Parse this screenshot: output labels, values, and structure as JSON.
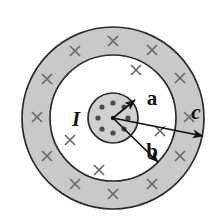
{
  "figure": {
    "center": {
      "x": 113,
      "y": 118
    },
    "colors": {
      "outline": "#2b2b2b",
      "shaded_ring_fill": "#c9c9c9",
      "inner_conductor_fill": "#d0d0d0",
      "gap_fill": "#ffffff",
      "dot_fill": "#4a4a4a",
      "cross_stroke": "#6a6a6a",
      "arrow_stroke": "#111111",
      "label_color": "#111111",
      "background": "#ffffff"
    },
    "circles": [
      {
        "name": "inner-conductor",
        "radius": 25,
        "fill": "#d0d0d0"
      },
      {
        "name": "inner-shield-boundary",
        "radius": 63,
        "fill": "#ffffff"
      },
      {
        "name": "outer-shield-boundary",
        "radius": 91,
        "fill": "#c9c9c9"
      }
    ],
    "labels": [
      {
        "key": "a",
        "text": "a",
        "x": 152,
        "y": 105,
        "style": "upright"
      },
      {
        "key": "b",
        "text": "b",
        "x": 152,
        "y": 158,
        "style": "upright"
      },
      {
        "key": "c",
        "text": "c",
        "x": 196,
        "y": 119,
        "style": "italic"
      },
      {
        "key": "I",
        "text": "I",
        "x": 76,
        "y": 126,
        "style": "italic"
      }
    ],
    "arrows": [
      {
        "name": "radius-a-arrow",
        "from_label": "center",
        "to_label": "a",
        "x1": 113,
        "y1": 118,
        "x2": 135,
        "y2": 100
      },
      {
        "name": "radius-b-arrow",
        "from_label": "center",
        "to_label": "b",
        "x1": 113,
        "y1": 118,
        "x2": 158,
        "y2": 162
      },
      {
        "name": "radius-c-arrow",
        "from_label": "center",
        "to_label": "c",
        "x1": 113,
        "y1": 118,
        "x2": 203,
        "y2": 136
      }
    ],
    "current_dots": {
      "name": "current-out-of-page-dots",
      "count": 8,
      "ring_radius": 15,
      "dot_radius": 2.6,
      "positions": [
        {
          "x": 113,
          "y": 103
        },
        {
          "x": 124,
          "y": 107
        },
        {
          "x": 128,
          "y": 118
        },
        {
          "x": 124,
          "y": 129
        },
        {
          "x": 113,
          "y": 133
        },
        {
          "x": 102,
          "y": 129
        },
        {
          "x": 98,
          "y": 118
        },
        {
          "x": 102,
          "y": 107
        }
      ]
    },
    "current_crosses": {
      "name": "current-into-page-crosses",
      "count": 16,
      "size": 5,
      "positions": [
        {
          "x": 113,
          "y": 41
        },
        {
          "x": 152,
          "y": 50
        },
        {
          "x": 180,
          "y": 78
        },
        {
          "x": 189,
          "y": 117
        },
        {
          "x": 180,
          "y": 156
        },
        {
          "x": 152,
          "y": 184
        },
        {
          "x": 113,
          "y": 194
        },
        {
          "x": 75,
          "y": 184
        },
        {
          "x": 47,
          "y": 156
        },
        {
          "x": 37,
          "y": 117
        },
        {
          "x": 47,
          "y": 79
        },
        {
          "x": 75,
          "y": 51
        },
        {
          "x": 136,
          "y": 70
        },
        {
          "x": 160,
          "y": 131
        },
        {
          "x": 99,
          "y": 170
        },
        {
          "x": 70,
          "y": 140
        }
      ]
    }
  }
}
